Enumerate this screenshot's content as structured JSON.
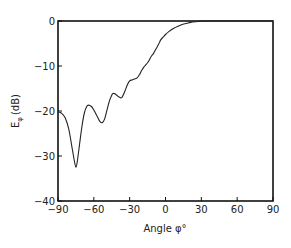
{
  "chart_data": {
    "type": "line",
    "title": "",
    "xlabel": "Angle φ°",
    "ylabel": "Eφ (dB)",
    "ylabel_main": "E",
    "ylabel_sub": "φ",
    "ylabel_unit": "(dB)",
    "xlim": [
      -90,
      90
    ],
    "ylim": [
      -40,
      0
    ],
    "xticks": [
      -90,
      -60,
      -30,
      0,
      30,
      60,
      90
    ],
    "xtick_labels": [
      "−90",
      "−60",
      "−30",
      "0",
      "30",
      "60",
      "90"
    ],
    "yticks": [
      0,
      -10,
      -20,
      -30,
      -40
    ],
    "ytick_labels": [
      "0",
      "−10",
      "−20",
      "−30",
      "−40"
    ],
    "grid": false,
    "legend": null,
    "series": [
      {
        "name": "E_phi",
        "x": [
          -90,
          -87,
          -84,
          -81,
          -78,
          -76,
          -75,
          -74,
          -72,
          -70,
          -68,
          -66,
          -64.5,
          -62,
          -60,
          -57,
          -55,
          -53,
          -51,
          -49,
          -47,
          -45,
          -44,
          -42,
          -40,
          -38,
          -36.5,
          -34,
          -32,
          -30,
          -28,
          -26,
          -24,
          -22,
          -20,
          -18,
          -16,
          -14,
          -12,
          -10,
          -8,
          -6,
          -4,
          -2,
          0,
          3,
          7,
          10,
          14,
          18,
          21,
          25,
          28,
          32,
          40,
          50,
          60,
          70,
          80,
          90
        ],
        "y": [
          -20.2,
          -20.5,
          -21.5,
          -24,
          -28.5,
          -31.5,
          -32.5,
          -31.5,
          -27.5,
          -23.5,
          -20.5,
          -19,
          -18.7,
          -19,
          -19.8,
          -21.3,
          -22.3,
          -22.6,
          -21.8,
          -19.8,
          -17.8,
          -16.5,
          -16.1,
          -16.2,
          -16.7,
          -17,
          -17,
          -15.6,
          -14.2,
          -13.3,
          -13.1,
          -12.9,
          -12.7,
          -12,
          -11,
          -10.2,
          -9.6,
          -8.9,
          -7.9,
          -7.2,
          -6.2,
          -5.3,
          -4.2,
          -3.6,
          -3,
          -2.3,
          -1.6,
          -1.2,
          -0.8,
          -0.5,
          -0.3,
          -0.15,
          -0.08,
          0,
          0,
          0,
          0,
          0,
          0,
          0
        ]
      }
    ],
    "line_color": "#222222"
  }
}
